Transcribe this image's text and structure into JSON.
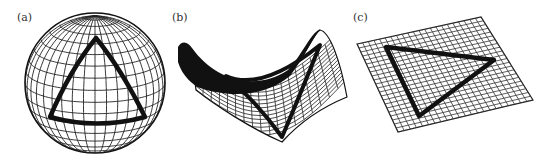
{
  "figure": {
    "panels": [
      {
        "id": "a",
        "label": "(a)",
        "surface": "sphere",
        "curvature": "positive"
      },
      {
        "id": "b",
        "label": "(b)",
        "surface": "saddle",
        "curvature": "negative"
      },
      {
        "id": "c",
        "label": "(c)",
        "surface": "plane",
        "curvature": "zero"
      }
    ],
    "colors": {
      "ink": "#111111",
      "grid": "#222222",
      "background": "#ffffff"
    }
  }
}
